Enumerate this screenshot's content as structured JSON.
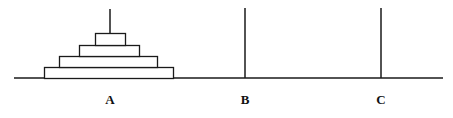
{
  "figure": {
    "type": "tower-of-hanoi-diagram",
    "width": 453,
    "height": 118,
    "background_color": "#ffffff",
    "stroke_color": "#1a1a1a",
    "baseline": {
      "x_start": 14,
      "x_end": 443,
      "y": 78,
      "thickness": 1.6
    },
    "pegs": [
      {
        "id": "A",
        "label": "A",
        "x": 110,
        "rod_top_y": 9,
        "rod_bottom_y": 78,
        "label_x": 98,
        "label_y": 93,
        "disc_count": 4,
        "empty": false
      },
      {
        "id": "B",
        "label": "B",
        "x": 245,
        "rod_top_y": 8,
        "rod_bottom_y": 78,
        "label_x": 233,
        "label_y": 93,
        "disc_count": 0,
        "empty": true
      },
      {
        "id": "C",
        "label": "C",
        "x": 381,
        "rod_top_y": 8,
        "rod_bottom_y": 78,
        "label_x": 369,
        "label_y": 93,
        "disc_count": 0,
        "empty": true
      }
    ],
    "discs": [
      {
        "index": 1,
        "size_rank": "largest",
        "peg": "A",
        "x": 44,
        "y": 67,
        "width": 129,
        "height": 11
      },
      {
        "index": 2,
        "size_rank": "large",
        "peg": "A",
        "x": 59,
        "y": 56,
        "width": 98,
        "height": 11
      },
      {
        "index": 3,
        "size_rank": "medium",
        "peg": "A",
        "x": 79,
        "y": 45,
        "width": 60,
        "height": 11
      },
      {
        "index": 4,
        "size_rank": "smallest",
        "peg": "A",
        "x": 95,
        "y": 33,
        "width": 30,
        "height": 12
      }
    ]
  }
}
